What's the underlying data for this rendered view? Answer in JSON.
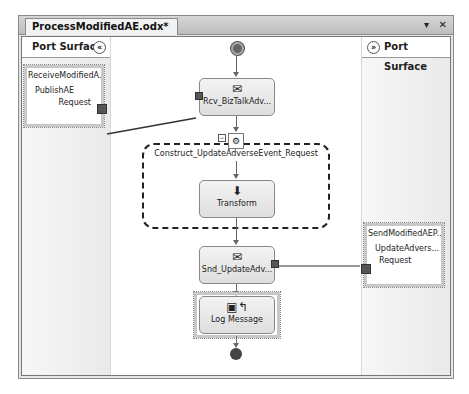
{
  "window": {
    "tab_title": "ProcessModifiedAE.odx*",
    "controls": {
      "dropdown": "▾",
      "close": "✕"
    }
  },
  "port_surface_left": {
    "header": "Port Surface",
    "collapse_glyph": "«",
    "port": {
      "title": "ReceiveModifiedA...",
      "operation": "PublishAE",
      "message": "Request"
    }
  },
  "port_surface_right": {
    "header": "Port Surface",
    "collapse_glyph": "»",
    "port": {
      "title": "SendModifiedAEP...",
      "operation": "UpdateAdvers...",
      "message": "Request"
    }
  },
  "orchestration": {
    "receive_shape": {
      "label": "Rcv_BizTalkAdv...",
      "icon": "receive-envelope-icon",
      "glyph": "✉"
    },
    "construct_scope": {
      "label": "Construct_UpdateAdverseEvent_Request",
      "icon_glyph": "⚙",
      "collapse_glyph": "−"
    },
    "transform_shape": {
      "label": "Transform",
      "icon": "transform-icon",
      "glyph": "⬇"
    },
    "send_shape": {
      "label": "Snd_UpdateAdv...",
      "icon": "send-envelope-icon",
      "glyph": "✉"
    },
    "log_shape": {
      "label": "Log Message",
      "icon": "expression-icon",
      "glyph": "▣↰"
    }
  }
}
